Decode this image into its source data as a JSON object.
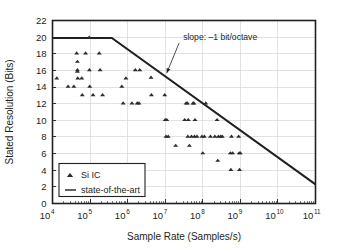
{
  "chart_data": {
    "type": "scatter",
    "title": "",
    "xlabel": "Sample Rate (Samples/s)",
    "ylabel": "Stated Resolution (Bits)",
    "xscale": "log",
    "yscale": "linear",
    "xlim": [
      10000,
      100000000000
    ],
    "ylim": [
      0,
      22
    ],
    "grid": true,
    "xticks": [
      {
        "value": 10000,
        "label": "10",
        "exponent": "4"
      },
      {
        "value": 100000,
        "label": "10",
        "exponent": "5"
      },
      {
        "value": 1000000,
        "label": "10",
        "exponent": "6"
      },
      {
        "value": 10000000,
        "label": "10",
        "exponent": "7"
      },
      {
        "value": 100000000,
        "label": "10",
        "exponent": "8"
      },
      {
        "value": 1000000000,
        "label": "10",
        "exponent": "9"
      },
      {
        "value": 10000000000,
        "label": "10",
        "exponent": "10"
      },
      {
        "value": 100000000000,
        "label": "10",
        "exponent": "11"
      }
    ],
    "yticks": [
      0,
      2,
      4,
      6,
      8,
      10,
      12,
      14,
      16,
      18,
      20,
      22
    ],
    "legend_position": "bottom-left",
    "legend": [
      {
        "label": "Si IC",
        "marker": "triangle",
        "color": "#2b2b2b"
      },
      {
        "label": "state-of-the-art",
        "marker": "line",
        "color": "#231f20"
      }
    ],
    "annotations": [
      {
        "text": "slope: –1 bit/octave",
        "x": 30000000,
        "y": 19.6,
        "arrow_to_x": 11000000,
        "arrow_to_y": 15.7
      }
    ],
    "series": [
      {
        "name": "state-of-the-art",
        "type": "line",
        "color": "#231f20",
        "points": [
          {
            "x": 10000,
            "y": 19.9
          },
          {
            "x": 380000,
            "y": 19.9
          },
          {
            "x": 100000000000,
            "y": 2.3
          }
        ]
      },
      {
        "name": "Si IC",
        "type": "scatter",
        "marker": "triangle",
        "color": "#2b2b2b",
        "points": [
          {
            "x": 13000,
            "y": 15.1
          },
          {
            "x": 26000,
            "y": 14.1
          },
          {
            "x": 37000,
            "y": 14.1
          },
          {
            "x": 44000,
            "y": 18.1
          },
          {
            "x": 46000,
            "y": 17.1
          },
          {
            "x": 46000,
            "y": 16.1
          },
          {
            "x": 46000,
            "y": 15.9
          },
          {
            "x": 47000,
            "y": 15.1
          },
          {
            "x": 60000,
            "y": 15.1
          },
          {
            "x": 62000,
            "y": 13.1
          },
          {
            "x": 76000,
            "y": 18.1
          },
          {
            "x": 95000,
            "y": 20.0
          },
          {
            "x": 96000,
            "y": 16.1
          },
          {
            "x": 98000,
            "y": 14.1
          },
          {
            "x": 120000,
            "y": 13.1
          },
          {
            "x": 175000,
            "y": 18.1
          },
          {
            "x": 185000,
            "y": 16.1
          },
          {
            "x": 215000,
            "y": 13.1
          },
          {
            "x": 700000,
            "y": 14.1
          },
          {
            "x": 760000,
            "y": 12.1
          },
          {
            "x": 900000,
            "y": 15.1
          },
          {
            "x": 1300000,
            "y": 12.1
          },
          {
            "x": 1600000,
            "y": 16.1
          },
          {
            "x": 1800000,
            "y": 12.1
          },
          {
            "x": 2000000,
            "y": 12.1
          },
          {
            "x": 2100000,
            "y": 16.1
          },
          {
            "x": 4200000,
            "y": 15.2
          },
          {
            "x": 4300000,
            "y": 13.1
          },
          {
            "x": 9700000,
            "y": 13.1
          },
          {
            "x": 10000000,
            "y": 10.1
          },
          {
            "x": 11000000,
            "y": 10.1
          },
          {
            "x": 10500000,
            "y": 8.1
          },
          {
            "x": 12000000,
            "y": 8.1
          },
          {
            "x": 19000000,
            "y": 7.0
          },
          {
            "x": 33000000,
            "y": 10.1
          },
          {
            "x": 36000000,
            "y": 12.1
          },
          {
            "x": 39000000,
            "y": 12.1
          },
          {
            "x": 40000000,
            "y": 8.1
          },
          {
            "x": 41000000,
            "y": 10.1
          },
          {
            "x": 44000000,
            "y": 7.0
          },
          {
            "x": 50000000,
            "y": 8.1
          },
          {
            "x": 55000000,
            "y": 12.1
          },
          {
            "x": 58000000,
            "y": 12.1
          },
          {
            "x": 60000000,
            "y": 8.1
          },
          {
            "x": 62000000,
            "y": 10.1
          },
          {
            "x": 70000000,
            "y": 8.1
          },
          {
            "x": 95000000,
            "y": 8.1
          },
          {
            "x": 100000000,
            "y": 6.1
          },
          {
            "x": 110000000,
            "y": 8.1
          },
          {
            "x": 120000000,
            "y": 12.1
          },
          {
            "x": 160000000,
            "y": 8.1
          },
          {
            "x": 210000000,
            "y": 8.1
          },
          {
            "x": 240000000,
            "y": 10.1
          },
          {
            "x": 250000000,
            "y": 5.2
          },
          {
            "x": 260000000,
            "y": 8.1
          },
          {
            "x": 300000000,
            "y": 8.1
          },
          {
            "x": 330000000,
            "y": 8.1
          },
          {
            "x": 540000000,
            "y": 6.1
          },
          {
            "x": 560000000,
            "y": 4.1
          },
          {
            "x": 580000000,
            "y": 8.1
          },
          {
            "x": 620000000,
            "y": 6.1
          },
          {
            "x": 900000000,
            "y": 8.1
          },
          {
            "x": 930000000,
            "y": 6.1
          },
          {
            "x": 950000000,
            "y": 4.1
          },
          {
            "x": 1000000000,
            "y": 6.1
          }
        ]
      }
    ]
  }
}
